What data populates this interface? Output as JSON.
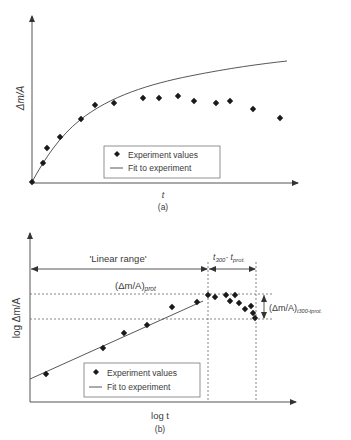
{
  "chart_data": [
    {
      "type": "scatter",
      "panel_label": "(a)",
      "title": "",
      "xlabel": "t",
      "ylabel": "Δm/A",
      "grid": false,
      "legend_position": "lower center",
      "legend": [
        "Experiment values",
        "Fit to experiment"
      ],
      "series": [
        {
          "name": "Experiment values",
          "kind": "markers",
          "x_px": [
            32,
            43,
            47,
            60,
            81,
            95,
            114,
            143,
            159,
            178,
            194,
            216,
            230,
            253,
            280
          ],
          "y_px": [
            182,
            163,
            148,
            137,
            119,
            105,
            103,
            98,
            98,
            96,
            101,
            103,
            101,
            109,
            118
          ]
        },
        {
          "name": "Fit to experiment",
          "kind": "line",
          "shape": "saturating growth curve from origin",
          "x_px": [
            32,
            40,
            50,
            60,
            75,
            95,
            120,
            150,
            180,
            210,
            240,
            265,
            287
          ],
          "y_px": [
            182,
            165,
            150,
            138,
            123,
            107,
            95,
            85,
            77,
            71,
            66,
            63,
            61
          ]
        }
      ]
    },
    {
      "type": "scatter",
      "panel_label": "(b)",
      "title": "",
      "xlabel": "log t",
      "ylabel": "log Δm/A",
      "grid": false,
      "legend_position": "lower center",
      "legend": [
        "Experiment values",
        "Fit to experiment"
      ],
      "annotations": {
        "linear_range": "'Linear range'",
        "time_interval": "t300-tprot.",
        "prot_level": "(Δm/A)prot",
        "delta_level": "(Δm/A)t300-tprot."
      },
      "series": [
        {
          "name": "Experiment values",
          "kind": "markers",
          "x_px": [
            46,
            103,
            124,
            147,
            172,
            197,
            208,
            215,
            226,
            235,
            230,
            239,
            245,
            251,
            253,
            255
          ],
          "y_px": [
            374,
            348,
            333,
            325,
            307,
            302,
            295,
            297,
            295,
            295,
            301,
            303,
            309,
            306,
            313,
            318
          ]
        },
        {
          "name": "Fit to experiment",
          "kind": "line",
          "x_px": [
            30,
            203
          ],
          "y_px": [
            379,
            301
          ]
        }
      ]
    }
  ],
  "panel_a": {
    "ylabel": "Δm/A",
    "xlabel": "t",
    "caption": "(a)",
    "legend": {
      "markers": "Experiment values",
      "line": "Fit to experiment"
    }
  },
  "panel_b": {
    "ylabel": "log Δm/A",
    "xlabel": "log t",
    "caption": "(b)",
    "linear_range": "'Linear range'",
    "t_interval_main": "t",
    "t_interval_sub1": "300",
    "t_interval_mid": "- t",
    "t_interval_sub2": "prot.",
    "prot_main": "(Δm/A)",
    "prot_sub": "prot",
    "delta_main": "(Δm/A)",
    "delta_sub": "t300-tprot.",
    "legend": {
      "markers": "Experiment values",
      "line": "Fit to experiment"
    }
  }
}
